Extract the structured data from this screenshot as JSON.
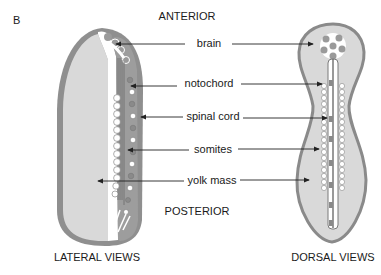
{
  "panel_label": "B",
  "orientation": {
    "top": "ANTERIOR",
    "bottom": "POSTERIOR"
  },
  "structures": [
    {
      "label": "brain",
      "y": 41
    },
    {
      "label": "notochord",
      "y": 80
    },
    {
      "label": "spinal cord",
      "y": 115
    },
    {
      "label": "somites",
      "y": 149
    },
    {
      "label": "yolk mass",
      "y": 180
    }
  ],
  "views": {
    "left": "LATERAL VIEWS",
    "right": "DORSAL VIEWS"
  },
  "colors": {
    "outline": "#8a8a8a",
    "yolk_fill": "#d9d9d9",
    "dark_dot": "#9a9a9a",
    "light": "#ffffff",
    "arrow": "#222222"
  }
}
